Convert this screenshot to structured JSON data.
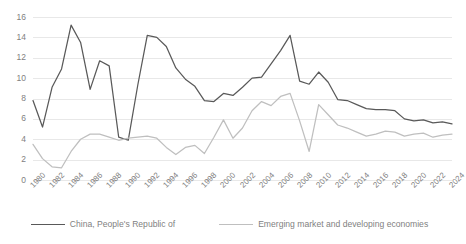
{
  "chart_data": {
    "type": "line",
    "title": "",
    "xlabel": "",
    "ylabel": "",
    "ylim": [
      0,
      16
    ],
    "ytick_step": 2,
    "yticks": [
      "0",
      "2",
      "4",
      "6",
      "8",
      "10",
      "12",
      "14",
      "16"
    ],
    "grid": true,
    "legend_position": "bottom",
    "x": [
      1980,
      1981,
      1982,
      1983,
      1984,
      1985,
      1986,
      1987,
      1988,
      1989,
      1990,
      1991,
      1992,
      1993,
      1994,
      1995,
      1996,
      1997,
      1998,
      1999,
      2000,
      2001,
      2002,
      2003,
      2004,
      2005,
      2006,
      2007,
      2008,
      2009,
      2010,
      2011,
      2012,
      2013,
      2014,
      2015,
      2016,
      2017,
      2018,
      2019,
      2020,
      2021,
      2022,
      2023,
      2024
    ],
    "xtick_labels": [
      "1980",
      "1982",
      "1984",
      "1986",
      "1988",
      "1990",
      "1992",
      "1994",
      "1996",
      "1998",
      "2000",
      "2002",
      "2004",
      "2006",
      "2008",
      "2010",
      "2012",
      "2014",
      "2016",
      "2018",
      "2020",
      "2022",
      "2024"
    ],
    "series": [
      {
        "name": "China, People's Republic of",
        "color": "#595959",
        "values": [
          7.8,
          5.2,
          9.1,
          10.9,
          15.2,
          13.5,
          8.9,
          11.7,
          11.2,
          4.2,
          3.9,
          9.3,
          14.2,
          14.0,
          13.1,
          11.0,
          9.9,
          9.2,
          7.8,
          7.7,
          8.5,
          8.3,
          9.1,
          10.0,
          10.1,
          11.4,
          12.7,
          14.2,
          9.7,
          9.4,
          10.6,
          9.6,
          7.9,
          7.8,
          7.4,
          7.0,
          6.9,
          6.9,
          6.8,
          6.0,
          5.8,
          5.9,
          5.6,
          5.7,
          5.5
        ]
      },
      {
        "name": "Emerging market and developing economies",
        "color": "#bfbfbf",
        "values": [
          3.5,
          2.1,
          1.3,
          1.2,
          2.8,
          4.0,
          4.5,
          4.5,
          4.2,
          3.9,
          4.1,
          4.2,
          4.3,
          4.1,
          3.2,
          2.5,
          3.2,
          3.4,
          2.6,
          4.2,
          5.9,
          4.1,
          5.1,
          6.8,
          7.7,
          7.3,
          8.2,
          8.5,
          5.8,
          2.8,
          7.4,
          6.4,
          5.4,
          5.1,
          4.7,
          4.3,
          4.5,
          4.8,
          4.7,
          4.3,
          4.5,
          4.6,
          4.2,
          4.4,
          4.5
        ]
      }
    ]
  },
  "legend": {
    "items": [
      {
        "label": "China, People's Republic of",
        "color": "#595959"
      },
      {
        "label": "Emerging market and developing economies",
        "color": "#bfbfbf"
      }
    ]
  }
}
